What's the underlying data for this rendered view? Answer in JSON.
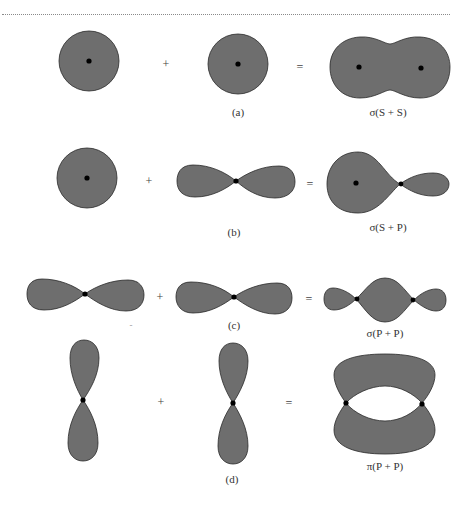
{
  "figure": {
    "fill_color": "#6e6e6e",
    "stroke_color": "#2a2a2a",
    "nucleus_color": "#000000",
    "rows": [
      {
        "id": "a",
        "label": "(a)",
        "operator_plus": "+",
        "operator_equals": "=",
        "left": "s-orbital",
        "middle": "s-orbital",
        "result": "sigma-bond-s-s",
        "result_label": "σ(S + S)"
      },
      {
        "id": "b",
        "label": "(b)",
        "operator_plus": "+",
        "operator_equals": "=",
        "left": "s-orbital",
        "middle": "p-orbital-horizontal",
        "result": "sigma-bond-s-p",
        "result_label": "σ(S + P)"
      },
      {
        "id": "c",
        "label": "(c)",
        "operator_plus": "+",
        "operator_equals": "=",
        "left": "p-orbital-horizontal",
        "middle": "p-orbital-horizontal",
        "result": "sigma-bond-p-p",
        "result_label": "σ(P + P)",
        "stray_mark": "-"
      },
      {
        "id": "d",
        "label": "(d)",
        "operator_plus": "+",
        "operator_equals": "=",
        "left": "p-orbital-vertical",
        "middle": "p-orbital-vertical",
        "result": "pi-bond-p-p",
        "result_label": "π(P + P)"
      }
    ]
  }
}
